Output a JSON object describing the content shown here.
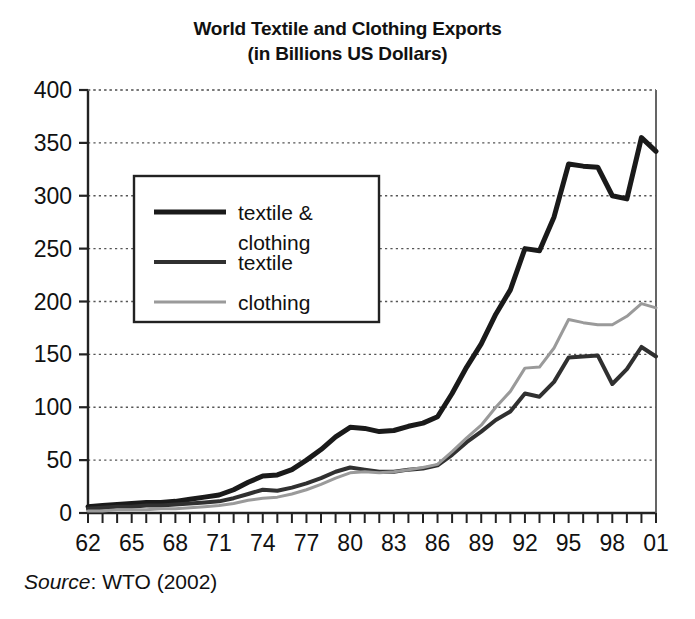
{
  "chart_data": {
    "type": "line",
    "title": "World Textile and Clothing Exports",
    "subtitle": "(in Billions US Dollars)",
    "title_line1": "World Textile and Clothing Exports",
    "title_line2": "(in Billions US Dollars)",
    "xlabel": "",
    "ylabel": "",
    "ylim": [
      0,
      400
    ],
    "xlim": [
      1962,
      2001
    ],
    "grid": true,
    "grid_style": "dotted-horizontal",
    "legend_position": "upper-left-inside",
    "y_ticks": [
      0,
      50,
      100,
      150,
      200,
      250,
      300,
      350,
      400
    ],
    "y_tick_labels": [
      "0",
      "50",
      "100",
      "150",
      "200",
      "250",
      "300",
      "350",
      "400"
    ],
    "x_tick_labels": [
      "62",
      "65",
      "68",
      "71",
      "74",
      "77",
      "80",
      "83",
      "86",
      "89",
      "92",
      "95",
      "98",
      "01"
    ],
    "x_tick_label_years": [
      1962,
      1965,
      1968,
      1971,
      1974,
      1977,
      1980,
      1983,
      1986,
      1989,
      1992,
      1995,
      1998,
      2001
    ],
    "x": [
      1962,
      1963,
      1964,
      1965,
      1966,
      1967,
      1968,
      1969,
      1970,
      1971,
      1972,
      1973,
      1974,
      1975,
      1976,
      1977,
      1978,
      1979,
      1980,
      1981,
      1982,
      1983,
      1984,
      1985,
      1986,
      1987,
      1988,
      1989,
      1990,
      1991,
      1992,
      1993,
      1994,
      1995,
      1996,
      1997,
      1998,
      1999,
      2000,
      2001
    ],
    "series": [
      {
        "name": "textile & clothing",
        "color": "#1a1a1a",
        "width": 5,
        "values": [
          6,
          7,
          8,
          9,
          10,
          10,
          11,
          13,
          15,
          17,
          22,
          29,
          35,
          36,
          41,
          50,
          60,
          72,
          81,
          80,
          77,
          78,
          82,
          85,
          91,
          113,
          138,
          160,
          188,
          211,
          250,
          248,
          280,
          330,
          328,
          327,
          300,
          297,
          355,
          342
        ]
      },
      {
        "name": "textile",
        "color": "#303030",
        "width": 4,
        "values": [
          4,
          5,
          6,
          6,
          7,
          7,
          8,
          9,
          10,
          11,
          14,
          18,
          22,
          21,
          24,
          28,
          33,
          39,
          43,
          41,
          39,
          39,
          41,
          42,
          45,
          55,
          67,
          77,
          88,
          96,
          113,
          110,
          124,
          147,
          148,
          149,
          122,
          136,
          157,
          148
        ]
      },
      {
        "name": "clothing",
        "color": "#9a9a9a",
        "width": 3,
        "values": [
          2,
          2,
          3,
          3,
          3,
          4,
          4,
          5,
          6,
          7,
          9,
          12,
          14,
          15,
          18,
          22,
          27,
          33,
          38,
          39,
          38,
          39,
          41,
          43,
          46,
          58,
          71,
          83,
          100,
          115,
          137,
          138,
          156,
          183,
          180,
          178,
          178,
          186,
          198,
          194
        ]
      }
    ]
  },
  "legend": {
    "entries": [
      {
        "label_line1": "textile &",
        "label_line2": "clothing",
        "label": "textile & clothing"
      },
      {
        "label_line1": "textile",
        "label_line2": "",
        "label": "textile"
      },
      {
        "label_line1": "clothing",
        "label_line2": "",
        "label": "clothing"
      }
    ]
  },
  "source": {
    "prefix": "Source",
    "separator": ": ",
    "text": "WTO (2002)",
    "full": "Source: WTO (2002)"
  }
}
